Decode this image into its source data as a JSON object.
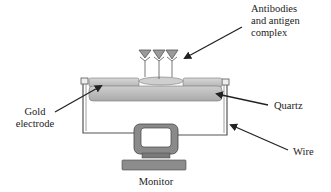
{
  "diagram": {
    "type": "biosensor-schematic",
    "labels": {
      "antibodies_line1": "Antibodies",
      "antibodies_line2": "and antigen",
      "antibodies_line3": "complex",
      "gold_line1": "Gold",
      "gold_line2": "electrode",
      "quartz": "Quartz",
      "wire": "Wire",
      "monitor": "Monitor"
    },
    "colors": {
      "line": "#222222",
      "electrode_fill": "#bdbdbd",
      "quartz_fill": "#b8b8b8",
      "antibody_fill": "#9a9a9a",
      "monitor_fill": "#8a8a8a",
      "wire": "#444444"
    },
    "components": [
      "antibody-antigen-complex",
      "gold-electrode",
      "quartz-crystal",
      "wire",
      "monitor"
    ]
  }
}
